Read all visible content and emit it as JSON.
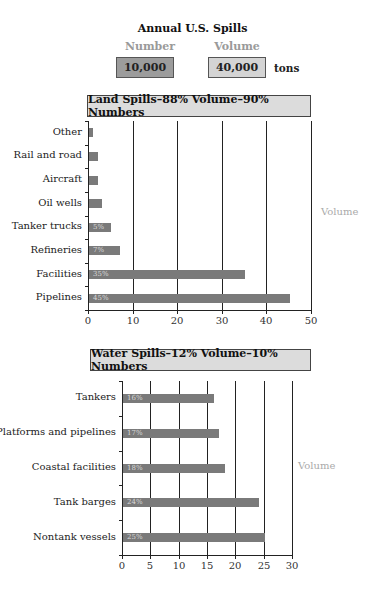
{
  "header": {
    "title": "Annual U.S. Spills",
    "number_label": "Number",
    "volume_label": "Volume",
    "number_value": "10,000",
    "volume_value": "40,000",
    "volume_unit": "tons"
  },
  "colors": {
    "bar": "#7a7a7a",
    "number_box": "#9c9c9c",
    "volume_box": "#d4d4d4",
    "chart_header_bg": "#dcdcdc",
    "muted_text": "#9a9a9a"
  },
  "chart_data": [
    {
      "type": "bar",
      "orientation": "horizontal",
      "title": "Land Spills–88% Volume–90% Numbers",
      "xlabel": "",
      "ylabel": "",
      "side_label": "Volume",
      "categories": [
        "Other",
        "Rail and road",
        "Aircraft",
        "Oil wells",
        "Tanker trucks",
        "Refineries",
        "Facilities",
        "Pipelines"
      ],
      "values": [
        1,
        2,
        2,
        3,
        5,
        7,
        35,
        45
      ],
      "bar_labels": [
        "",
        "",
        "",
        "",
        "5%",
        "7%",
        "35%",
        "45%"
      ],
      "xlim": [
        0,
        50
      ],
      "xticks": [
        "0",
        "10",
        "20",
        "30",
        "40",
        "50"
      ],
      "grid": "vertical"
    },
    {
      "type": "bar",
      "orientation": "horizontal",
      "title": "Water Spills–12% Volume–10% Numbers",
      "xlabel": "",
      "ylabel": "",
      "side_label": "Volume",
      "categories": [
        "Tankers",
        "Platforms and pipelines",
        "Coastal facilities",
        "Tank barges",
        "Nontank vessels"
      ],
      "values": [
        16,
        17,
        18,
        24,
        25
      ],
      "bar_labels": [
        "16%",
        "17%",
        "18%",
        "24%",
        "25%"
      ],
      "xlim": [
        0,
        30
      ],
      "xticks": [
        "0",
        "5",
        "10",
        "15",
        "20",
        "25",
        "30"
      ],
      "grid": "vertical"
    }
  ]
}
